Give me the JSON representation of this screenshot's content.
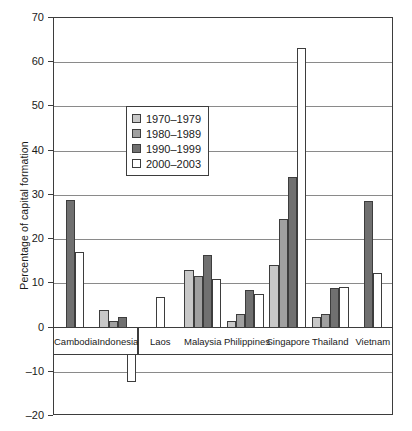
{
  "chart_data": {
    "type": "bar",
    "title": "",
    "xlabel": "",
    "ylabel": "Percentage of capital formation",
    "ylim": [
      -20,
      70
    ],
    "yticks": [
      -20,
      -10,
      0,
      10,
      20,
      30,
      40,
      50,
      60,
      70
    ],
    "grid": true,
    "legend_position": "inside-upper-left",
    "categories": [
      "Cambodia",
      "Indonesia",
      "Laos",
      "Malaysia",
      "Philippines",
      "Singapore",
      "Thailand",
      "Vietnam"
    ],
    "series": [
      {
        "name": "1970-1979",
        "color": "#c8c8c8",
        "values": [
          null,
          4.0,
          null,
          13.0,
          1.5,
          14.2,
          2.5,
          null
        ]
      },
      {
        "name": "1980-1989",
        "color": "#a0a0a0",
        "values": [
          null,
          1.5,
          null,
          11.6,
          3.0,
          24.5,
          3.1,
          null
        ]
      },
      {
        "name": "1990-1999",
        "color": "#707070",
        "values": [
          28.9,
          2.5,
          null,
          16.4,
          8.6,
          34.0,
          9.0,
          28.7
        ]
      },
      {
        "name": "2000-2003",
        "color": "#ffffff",
        "values": [
          17.0,
          -12.4,
          7.0,
          11.0,
          7.5,
          63.2,
          9.1,
          12.4
        ]
      }
    ]
  },
  "legend": {
    "items": [
      {
        "label": "1970-1979",
        "swatch": "#c8c8c8"
      },
      {
        "label": "1980-1989",
        "swatch": "#a0a0a0"
      },
      {
        "label": "1990-1999",
        "swatch": "#707070"
      },
      {
        "label": "2000-2003",
        "swatch": "#ffffff"
      }
    ]
  },
  "axis": {
    "y_title": "Percentage of capital formation",
    "tick_labels": [
      "70",
      "60",
      "50",
      "40",
      "30",
      "20",
      "10",
      "0",
      "-10",
      "-20"
    ]
  },
  "label_band_groups": [
    {
      "labels": [
        "Cambodia",
        "Indonesia"
      ]
    },
    {
      "labels": [
        "Laos",
        "Malaysia",
        "Philippines",
        "Singapore",
        "Thailand",
        "Vietnam"
      ]
    }
  ]
}
